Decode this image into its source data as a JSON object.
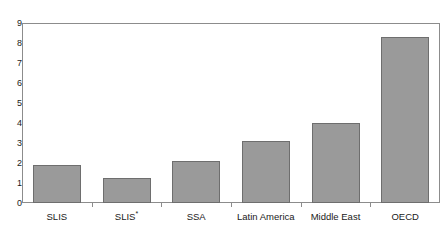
{
  "chart_data": {
    "type": "bar",
    "title": "",
    "subtitle": "",
    "xlabel": "",
    "ylabel": "",
    "categories": [
      "SLIS",
      "SLIS*",
      "SSA",
      "Latin America",
      "Middle East",
      "OECD"
    ],
    "values": [
      1.9,
      1.25,
      2.1,
      3.1,
      4.0,
      8.3
    ],
    "ylim": [
      0,
      9
    ],
    "y_ticks": [
      0,
      1,
      2,
      3,
      4,
      5,
      6,
      7,
      8,
      9
    ],
    "y_tick_labels": [
      "0",
      "1",
      "2",
      "3",
      "4",
      "5",
      "6",
      "7",
      "8",
      "9"
    ],
    "grid": false,
    "legend": null,
    "legend_position": "none",
    "annotations": [],
    "series": [
      {
        "name": "",
        "values": [
          1.9,
          1.25,
          2.1,
          3.1,
          4.0,
          8.3
        ]
      }
    ],
    "colors": {
      "bar_fill": "#9a9a9a",
      "bar_edge": "#6e6e6e",
      "axis": "#8c8c8c",
      "text": "#1a1a1a",
      "background": "#ffffff"
    }
  }
}
